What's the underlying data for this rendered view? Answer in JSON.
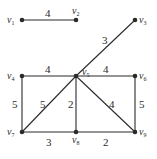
{
  "graph": {
    "nodes": [
      {
        "id": "v1",
        "label": "v",
        "sub": "1",
        "x": 22,
        "y": 20
      },
      {
        "id": "v2",
        "label": "v",
        "sub": "2",
        "x": 76,
        "y": 20
      },
      {
        "id": "v3",
        "label": "v",
        "sub": "3",
        "x": 135,
        "y": 20
      },
      {
        "id": "v4",
        "label": "v",
        "sub": "4",
        "x": 22,
        "y": 76
      },
      {
        "id": "v5",
        "label": "v",
        "sub": "5",
        "x": 76,
        "y": 76
      },
      {
        "id": "v6",
        "label": "v",
        "sub": "6",
        "x": 135,
        "y": 76
      },
      {
        "id": "v7",
        "label": "v",
        "sub": "7",
        "x": 22,
        "y": 132
      },
      {
        "id": "v8",
        "label": "v",
        "sub": "8",
        "x": 76,
        "y": 132
      },
      {
        "id": "v9",
        "label": "v",
        "sub": "9",
        "x": 135,
        "y": 132
      }
    ],
    "edges": [
      {
        "from": "v1",
        "to": "v2",
        "weight": "4"
      },
      {
        "from": "v5",
        "to": "v3",
        "weight": "3"
      },
      {
        "from": "v4",
        "to": "v5",
        "weight": "4"
      },
      {
        "from": "v5",
        "to": "v6",
        "weight": "4"
      },
      {
        "from": "v4",
        "to": "v7",
        "weight": "5"
      },
      {
        "from": "v7",
        "to": "v5",
        "weight": "5"
      },
      {
        "from": "v5",
        "to": "v8",
        "weight": "2"
      },
      {
        "from": "v5",
        "to": "v9",
        "weight": "4"
      },
      {
        "from": "v6",
        "to": "v9",
        "weight": "5"
      },
      {
        "from": "v7",
        "to": "v8",
        "weight": "3"
      },
      {
        "from": "v8",
        "to": "v9",
        "weight": "2"
      }
    ]
  }
}
